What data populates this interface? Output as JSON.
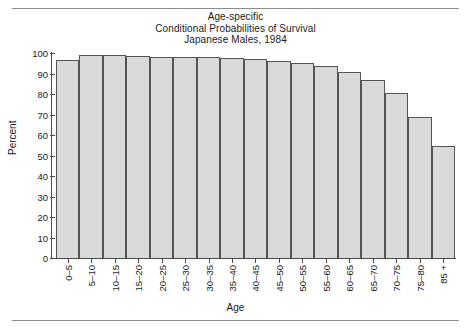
{
  "chart_data": {
    "type": "bar",
    "title": "Age-specific Conditional Probabilities of Survival Japanese Males, 1984",
    "title_lines": [
      "Age-specific",
      "Conditional Probabilities of Survival",
      "Japanese Males, 1984"
    ],
    "xlabel": "Age",
    "ylabel": "Percent",
    "ylim": [
      0,
      100
    ],
    "yticks": [
      0,
      10,
      20,
      30,
      40,
      50,
      60,
      70,
      80,
      90,
      100
    ],
    "grid": false,
    "legend": null,
    "categories": [
      "0–5",
      "5–10",
      "10–15",
      "15–20",
      "20–25",
      "25–30",
      "30–35",
      "35–40",
      "40–45",
      "45–50",
      "50–55",
      "55–60",
      "60–65",
      "65–70",
      "70–75",
      "75–80",
      "85 +"
    ],
    "values": [
      96.5,
      99,
      99,
      98.5,
      98,
      98,
      98,
      97.5,
      97,
      96,
      95,
      93.5,
      90.5,
      87,
      80.5,
      69,
      54.5
    ],
    "bar_fill": "#d9d9d9",
    "bar_edge": "#555555",
    "axis_color": "#4a4a4a"
  }
}
